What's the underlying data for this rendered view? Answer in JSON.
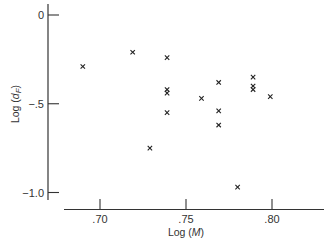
{
  "chart_data": {
    "type": "scatter",
    "title": "",
    "xlabel": "Log (M)",
    "ylabel": "Log (d_F)",
    "xlabel_parts": {
      "prefix": "Log (",
      "var": "M",
      "suffix": ")"
    },
    "ylabel_parts": {
      "prefix": "Log (",
      "var": "d",
      "sub": "F",
      "suffix": ")"
    },
    "x_ticks": [
      {
        "value": 0.7,
        "label": ".70"
      },
      {
        "value": 0.75,
        "label": ".75"
      },
      {
        "value": 0.8,
        "label": ".80"
      }
    ],
    "y_ticks": [
      {
        "value": 0,
        "label": "0"
      },
      {
        "value": -0.5,
        "label": "-.5"
      },
      {
        "value": -1.0,
        "label": "-1.0"
      }
    ],
    "xlim": [
      0.679,
      0.832
    ],
    "ylim": [
      -1.06,
      0.06
    ],
    "grid": false,
    "legend": null,
    "marker": "x",
    "points": [
      {
        "x": 0.69,
        "y": -0.29
      },
      {
        "x": 0.719,
        "y": -0.21
      },
      {
        "x": 0.729,
        "y": -0.75
      },
      {
        "x": 0.739,
        "y": -0.24
      },
      {
        "x": 0.739,
        "y": -0.42
      },
      {
        "x": 0.739,
        "y": -0.44
      },
      {
        "x": 0.739,
        "y": -0.55
      },
      {
        "x": 0.759,
        "y": -0.47
      },
      {
        "x": 0.769,
        "y": -0.38
      },
      {
        "x": 0.769,
        "y": -0.54
      },
      {
        "x": 0.769,
        "y": -0.62
      },
      {
        "x": 0.78,
        "y": -0.97
      },
      {
        "x": 0.789,
        "y": -0.35
      },
      {
        "x": 0.789,
        "y": -0.4
      },
      {
        "x": 0.789,
        "y": -0.42
      },
      {
        "x": 0.799,
        "y": -0.46
      }
    ]
  },
  "marker_glyph": "×",
  "colors": {
    "axis": "#333333",
    "marker": "#222222"
  }
}
